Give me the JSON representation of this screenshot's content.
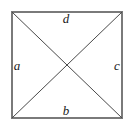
{
  "figure": {
    "canvas": {
      "width": 134,
      "height": 131,
      "background": "#ffffff"
    },
    "square": {
      "x": 12,
      "y": 12,
      "width": 110,
      "height": 106,
      "stroke_color": "#7a7a7a",
      "stroke_width": 2
    },
    "diagonals": {
      "stroke_color": "#4a4a4a",
      "stroke_width": 1,
      "count": 2,
      "intersection": {
        "x": 67,
        "y": 65
      }
    },
    "labels": {
      "top": "d",
      "bottom": "b",
      "left": "a",
      "right": "c"
    }
  }
}
